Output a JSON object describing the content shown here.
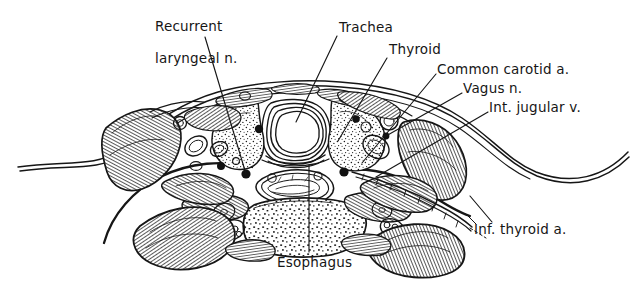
{
  "figure": {
    "type": "anatomical-cross-section",
    "background_color": "#ffffff",
    "ink_color": "#161616",
    "width": 639,
    "height": 281
  },
  "labels": [
    {
      "id": "recurrent-laryngeal-n",
      "text_line1": "Recurrent",
      "text_line2": "laryngeal n.",
      "full_text": "Recurrent laryngeal n.",
      "x": 146,
      "y": 4,
      "align": "left",
      "leader_from": [
        205,
        37
      ],
      "leader_to": [
        246,
        174
      ]
    },
    {
      "id": "trachea",
      "text_line1": "Trachea",
      "full_text": "Trachea",
      "x": 339,
      "y": 22,
      "align": "left",
      "leader_from": [
        337,
        36
      ],
      "leader_to": [
        296,
        122
      ]
    },
    {
      "id": "thyroid",
      "text_line1": "Thyroid",
      "full_text": "Thyroid",
      "x": 389,
      "y": 44,
      "align": "left",
      "leader_from": [
        387,
        58
      ],
      "leader_to": [
        338,
        141
      ]
    },
    {
      "id": "common-carotid-a",
      "text_line1": "Common carotid a.",
      "full_text": "Common carotid a.",
      "x": 438,
      "y": 65,
      "align": "left",
      "leader_from": [
        436,
        74
      ],
      "leader_to": [
        362,
        163
      ]
    },
    {
      "id": "vagus-n",
      "text_line1": "Vagus n.",
      "full_text": "Vagus n.",
      "x": 464,
      "y": 85,
      "align": "left",
      "leader_from": [
        462,
        93
      ],
      "leader_to": [
        386,
        122
      ]
    },
    {
      "id": "int-jugular-v",
      "text_line1": "Int. jugular v.",
      "full_text": "Int. jugular v.",
      "x": 490,
      "y": 104,
      "align": "left",
      "leader_from": [
        488,
        112
      ],
      "leader_to": [
        376,
        177
      ]
    },
    {
      "id": "inf-thyroid-a",
      "text_line1": "Inf. thyroid a.",
      "full_text": "Inf. thyroid a.",
      "x": 474,
      "y": 225,
      "align": "left",
      "leader_from": [
        492,
        223
      ],
      "leader_to": [
        470,
        196
      ]
    },
    {
      "id": "esophagus",
      "text_line1": "Esophagus",
      "full_text": "Esophagus",
      "x": 277,
      "y": 258,
      "align": "left",
      "leader_from": [
        309,
        252
      ],
      "leader_to": [
        309,
        165
      ]
    }
  ],
  "structures": [
    {
      "id": "skin-outline",
      "name": "Neck skin contour"
    },
    {
      "id": "trachea",
      "name": "Trachea with cartilage ring"
    },
    {
      "id": "thyroid-left-lobe",
      "name": "Thyroid gland left lobe"
    },
    {
      "id": "thyroid-right-lobe",
      "name": "Thyroid gland right lobe"
    },
    {
      "id": "esophagus",
      "name": "Esophagus"
    },
    {
      "id": "vertebral-body",
      "name": "Cervical vertebral body"
    },
    {
      "id": "sternocleidomastoid-left",
      "name": "Left sternocleidomastoid muscle"
    },
    {
      "id": "sternocleidomastoid-right",
      "name": "Right sternocleidomastoid muscle"
    },
    {
      "id": "strap-muscles",
      "name": "Infrahyoid strap muscles"
    },
    {
      "id": "carotid-sheath-left",
      "name": "Left carotid sheath contents"
    },
    {
      "id": "carotid-sheath-right",
      "name": "Right carotid sheath contents"
    },
    {
      "id": "posterior-neck-muscles",
      "name": "Posterior cervical musculature"
    }
  ]
}
